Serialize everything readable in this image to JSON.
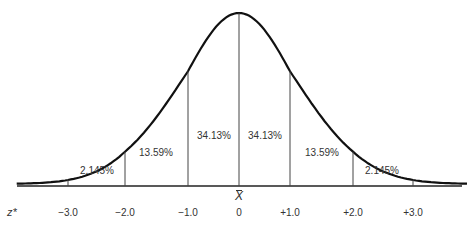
{
  "chart_data": {
    "type": "area",
    "title": "",
    "xlabel": "z*",
    "center_label": "X̄",
    "x_ticks": [
      "−3.0",
      "−2.0",
      "−1.0",
      "0",
      "+1.0",
      "+2.0",
      "+3.0"
    ],
    "x_values": [
      -3.0,
      -2.0,
      -1.0,
      0,
      1.0,
      2.0,
      3.0
    ],
    "segments": [
      {
        "from": -3.0,
        "to": -2.0,
        "label": "2.145%",
        "value": 2.145
      },
      {
        "from": -2.0,
        "to": -1.0,
        "label": "13.59%",
        "value": 13.59
      },
      {
        "from": -1.0,
        "to": 0,
        "label": "34.13%",
        "value": 34.13
      },
      {
        "from": 0,
        "to": 1.0,
        "label": "34.13%",
        "value": 34.13
      },
      {
        "from": 1.0,
        "to": 2.0,
        "label": "13.59%",
        "value": 13.59
      },
      {
        "from": 2.0,
        "to": 3.0,
        "label": "2.145%",
        "value": 2.145
      }
    ],
    "xlim": [
      -3.5,
      3.5
    ],
    "grid": false,
    "legend": "none"
  },
  "labels": {
    "z_axis": "z*",
    "xbar": "X",
    "ticks": [
      "−3.0",
      "−2.0",
      "−1.0",
      "0",
      "+1.0",
      "+2.0",
      "+3.0"
    ],
    "segments": [
      "2.145%",
      "13.59%",
      "34.13%",
      "34.13%",
      "13.59%",
      "2.145%"
    ]
  }
}
